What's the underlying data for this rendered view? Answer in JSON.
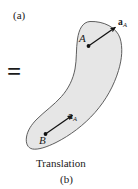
{
  "figure": {
    "type": "rigid-body-translation-diagram",
    "panel_label_a": "(a)",
    "panel_label_b": "(b)",
    "equals_sign": "=",
    "caption": "Translation",
    "body": {
      "name": "rigid-body-blob",
      "shape": "crescent",
      "fill_color": "#e6e6e6",
      "stroke_color": "#4d4d4d"
    },
    "points": [
      {
        "id": "point-a",
        "label": "A",
        "x": 88,
        "y": 46
      },
      {
        "id": "point-b",
        "label": "B",
        "x": 45,
        "y": 134
      }
    ],
    "vectors": [
      {
        "id": "vector-a-at-a",
        "symbol": "a",
        "subscript": "A",
        "from_point": "point-a",
        "tail_x": 88,
        "tail_y": 46,
        "head_x": 117,
        "head_y": 26,
        "color": "#111111"
      },
      {
        "id": "vector-a-at-b",
        "symbol": "a",
        "subscript": "A",
        "from_point": "point-b",
        "tail_x": 45,
        "tail_y": 134,
        "head_x": 74,
        "head_y": 114,
        "color": "#111111"
      }
    ]
  }
}
